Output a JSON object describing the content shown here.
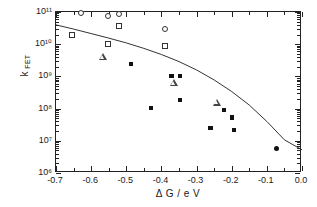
{
  "chart_data": {
    "type": "scatter",
    "title": "",
    "xlabel": "Δ G / e V",
    "ylabel": "k FET",
    "ylabel_base": "k",
    "ylabel_sub": "FET",
    "xlim": [
      -0.7,
      0.0
    ],
    "ylim_log10": [
      6,
      11
    ],
    "yscale": "log",
    "xticks": [
      -0.7,
      -0.6,
      -0.5,
      -0.4,
      -0.3,
      -0.2,
      -0.1,
      0.0
    ],
    "xticklabels": [
      "-0.7",
      "-0.6",
      "-0.5",
      "-0.4",
      "-0.3",
      "-0.2",
      "-0.1",
      "0.0"
    ],
    "yticks_log10": [
      6,
      7,
      8,
      9,
      10,
      11
    ],
    "yticklabels": [
      "10⁶",
      "10⁷",
      "10⁸",
      "10⁹",
      "10¹⁰",
      "10¹¹"
    ],
    "grid": false,
    "legend": "none",
    "series": [
      {
        "name": "open-circles",
        "marker": "open-circle",
        "points": [
          {
            "x": -0.629,
            "y_log10": 10.96
          },
          {
            "x": -0.552,
            "y_log10": 10.89
          },
          {
            "x": -0.521,
            "y_log10": 10.93
          },
          {
            "x": -0.39,
            "y_log10": 10.46
          }
        ]
      },
      {
        "name": "open-squares",
        "marker": "open-square",
        "points": [
          {
            "x": -0.655,
            "y_log10": 10.29
          },
          {
            "x": -0.552,
            "y_log10": 10.01
          },
          {
            "x": -0.521,
            "y_log10": 10.55
          },
          {
            "x": -0.39,
            "y_log10": 9.93
          }
        ]
      },
      {
        "name": "open-triangles",
        "marker": "open-triangle",
        "points": [
          {
            "x": -0.566,
            "y_log10": 9.59
          },
          {
            "x": -0.364,
            "y_log10": 8.78
          },
          {
            "x": -0.243,
            "y_log10": 8.18
          }
        ]
      },
      {
        "name": "filled-squares",
        "marker": "filled-square",
        "points": [
          {
            "x": -0.486,
            "y_log10": 9.39
          },
          {
            "x": -0.43,
            "y_log10": 8.02
          },
          {
            "x": -0.372,
            "y_log10": 9.02
          },
          {
            "x": -0.347,
            "y_log10": 9.02
          },
          {
            "x": -0.347,
            "y_log10": 8.26
          },
          {
            "x": -0.261,
            "y_log10": 7.39
          },
          {
            "x": -0.222,
            "y_log10": 7.96
          },
          {
            "x": -0.199,
            "y_log10": 7.72
          },
          {
            "x": -0.193,
            "y_log10": 7.34
          }
        ]
      },
      {
        "name": "filled-circle",
        "marker": "filled-circle",
        "points": [
          {
            "x": -0.072,
            "y_log10": 6.75
          }
        ]
      }
    ],
    "fit_curve": {
      "name": "marcus-fit",
      "style": "solid-line",
      "points": [
        {
          "x": -0.7,
          "y_log10": 10.6
        },
        {
          "x": -0.65,
          "y_log10": 10.47
        },
        {
          "x": -0.6,
          "y_log10": 10.33
        },
        {
          "x": -0.55,
          "y_log10": 10.19
        },
        {
          "x": -0.5,
          "y_log10": 10.04
        },
        {
          "x": -0.45,
          "y_log10": 9.87
        },
        {
          "x": -0.4,
          "y_log10": 9.68
        },
        {
          "x": -0.35,
          "y_log10": 9.46
        },
        {
          "x": -0.3,
          "y_log10": 9.2
        },
        {
          "x": -0.25,
          "y_log10": 8.89
        },
        {
          "x": -0.2,
          "y_log10": 8.53
        },
        {
          "x": -0.15,
          "y_log10": 8.11
        },
        {
          "x": -0.1,
          "y_log10": 7.6
        },
        {
          "x": -0.05,
          "y_log10": 7.03
        },
        {
          "x": 0.0,
          "y_log10": 6.72
        }
      ]
    }
  }
}
